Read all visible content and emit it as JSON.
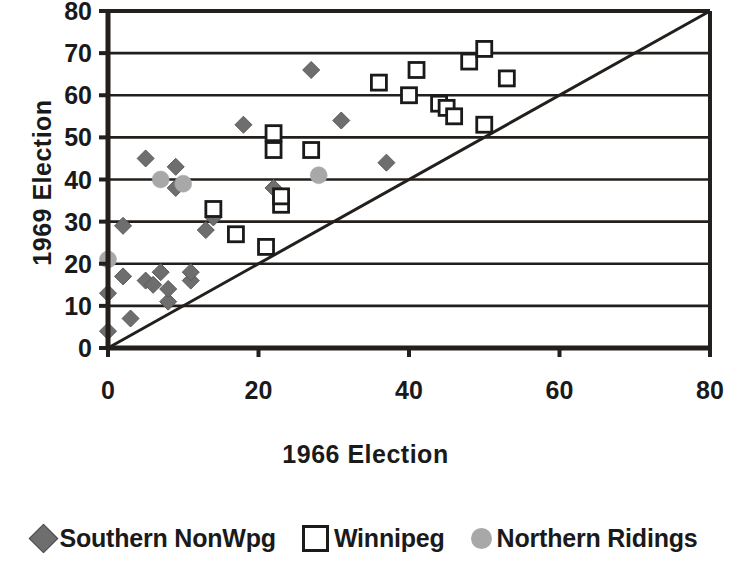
{
  "chart_data": {
    "type": "scatter",
    "title": "",
    "xlabel": "1966 Election",
    "ylabel": "1969 Election",
    "xlim": [
      0,
      80
    ],
    "ylim": [
      0,
      80
    ],
    "xticks": [
      0,
      20,
      40,
      60,
      80
    ],
    "yticks": [
      0,
      10,
      20,
      30,
      40,
      50,
      60,
      70,
      80
    ],
    "grid": "horizontal",
    "legend_position": "bottom",
    "reference_line": {
      "name": "y = x diagonal",
      "from": [
        0,
        0
      ],
      "to": [
        80,
        80
      ]
    },
    "series": [
      {
        "name": "Southern NonWpg",
        "marker": "filled-diamond",
        "color": "#6e6e6e",
        "points": [
          [
            0,
            4
          ],
          [
            0,
            13
          ],
          [
            2,
            17
          ],
          [
            2,
            29
          ],
          [
            3,
            7
          ],
          [
            5,
            16
          ],
          [
            5,
            45
          ],
          [
            6,
            15
          ],
          [
            7,
            18
          ],
          [
            8,
            11
          ],
          [
            8,
            14
          ],
          [
            9,
            38
          ],
          [
            9,
            43
          ],
          [
            11,
            16
          ],
          [
            11,
            18
          ],
          [
            13,
            28
          ],
          [
            14,
            31
          ],
          [
            18,
            53
          ],
          [
            22,
            38
          ],
          [
            27,
            66
          ],
          [
            31,
            54
          ],
          [
            37,
            44
          ]
        ]
      },
      {
        "name": "Winnipeg",
        "marker": "open-square",
        "color": "#1a1a1a",
        "points": [
          [
            14,
            33
          ],
          [
            17,
            27
          ],
          [
            21,
            24
          ],
          [
            22,
            47
          ],
          [
            22,
            51
          ],
          [
            23,
            34
          ],
          [
            23,
            36
          ],
          [
            27,
            47
          ],
          [
            36,
            63
          ],
          [
            40,
            60
          ],
          [
            41,
            66
          ],
          [
            44,
            58
          ],
          [
            45,
            57
          ],
          [
            46,
            55
          ],
          [
            48,
            68
          ],
          [
            50,
            53
          ],
          [
            50,
            71
          ],
          [
            53,
            64
          ]
        ]
      },
      {
        "name": "Northern Ridings",
        "marker": "filled-circle",
        "color": "#a8a8a8",
        "points": [
          [
            0,
            21
          ],
          [
            7,
            40
          ],
          [
            10,
            39
          ],
          [
            28,
            41
          ]
        ]
      }
    ]
  },
  "legend": {
    "items": [
      {
        "label": "Southern NonWpg",
        "marker": "diamond-icon"
      },
      {
        "label": "Winnipeg",
        "marker": "square-icon"
      },
      {
        "label": "Northern Ridings",
        "marker": "circle-icon"
      }
    ]
  },
  "axes": {
    "x_title": "1966 Election",
    "y_title": "1969 Election",
    "x_tick_labels": [
      "0",
      "20",
      "40",
      "60",
      "80"
    ],
    "y_tick_labels": [
      "0",
      "10",
      "20",
      "30",
      "40",
      "50",
      "60",
      "70",
      "80"
    ]
  },
  "colors": {
    "axis": "#231f1c",
    "grid": "#231f1c",
    "diamond": "#6e6e6e",
    "square_stroke": "#1a1a1a",
    "circle": "#a8a8a8",
    "background": "#ffffff"
  }
}
